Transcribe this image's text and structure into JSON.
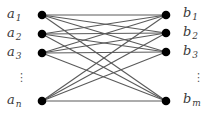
{
  "diagram": {
    "type": "complete-bipartite-graph",
    "left_nodes": [
      {
        "id": "a1",
        "name": "a",
        "sub": "1",
        "x": 42,
        "y": 15
      },
      {
        "id": "a2",
        "name": "a",
        "sub": "2",
        "x": 42,
        "y": 34
      },
      {
        "id": "a3",
        "name": "a",
        "sub": "3",
        "x": 42,
        "y": 53
      },
      {
        "id": "an",
        "name": "a",
        "sub": "n",
        "x": 42,
        "y": 101
      }
    ],
    "right_nodes": [
      {
        "id": "b1",
        "name": "b",
        "sub": "1",
        "x": 166,
        "y": 15
      },
      {
        "id": "b2",
        "name": "b",
        "sub": "2",
        "x": 166,
        "y": 33
      },
      {
        "id": "b3",
        "name": "b",
        "sub": "3",
        "x": 166,
        "y": 52
      },
      {
        "id": "bm",
        "name": "b",
        "sub": "m",
        "x": 166,
        "y": 101
      }
    ],
    "left_ellipsis": "⋮",
    "right_ellipsis": "⋮",
    "colors": {
      "node": "#000000",
      "edge": "#5a5a5a",
      "label": "#3a3a3a"
    }
  }
}
